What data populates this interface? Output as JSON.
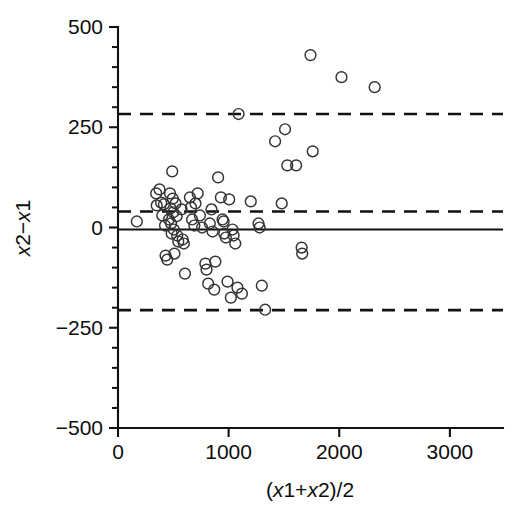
{
  "chart_data": {
    "type": "scatter",
    "title": "",
    "subtitle": "",
    "xlabel": "(x1+x2)/2",
    "ylabel": "x2-x1",
    "xlabel_parts": [
      "(",
      "x",
      "1+",
      "x",
      "2)/2"
    ],
    "ylabel_parts": [
      "x",
      "2−",
      "x",
      "1"
    ],
    "xlim": [
      0,
      3480
    ],
    "ylim": [
      -500,
      500
    ],
    "xticks": [
      0,
      1000,
      2000,
      3000
    ],
    "xtick_labels": [
      "0",
      "1000",
      "2000",
      "3000"
    ],
    "yticks": [
      -500,
      -250,
      0,
      250,
      500
    ],
    "ytick_labels": [
      "−500",
      "−250",
      "0",
      "250",
      "500"
    ],
    "y_minor_step": 50,
    "grid": false,
    "legend": null,
    "marker": {
      "shape": "open-circle",
      "radius": 5.4,
      "stroke": "#333333",
      "fill": "none"
    },
    "reference_lines": [
      {
        "name": "mean-difference",
        "value": -5,
        "style": "solid",
        "color": "#111111"
      },
      {
        "name": "upper-limit-of-agreement",
        "value": 283,
        "style": "dashed",
        "color": "#111111"
      },
      {
        "name": "mid-dashed-limit",
        "value": 40,
        "style": "dashed",
        "color": "#111111"
      },
      {
        "name": "lower-limit-of-agreement",
        "value": -206,
        "style": "dashed",
        "color": "#111111"
      }
    ],
    "series": [
      {
        "name": "difference-vs-mean",
        "points": [
          [
            170,
            15
          ],
          [
            345,
            85
          ],
          [
            350,
            55
          ],
          [
            375,
            95
          ],
          [
            390,
            62
          ],
          [
            400,
            30
          ],
          [
            415,
            58
          ],
          [
            425,
            5
          ],
          [
            430,
            -70
          ],
          [
            445,
            -80
          ],
          [
            460,
            20
          ],
          [
            470,
            85
          ],
          [
            475,
            48
          ],
          [
            480,
            10
          ],
          [
            485,
            -15
          ],
          [
            490,
            140
          ],
          [
            495,
            72
          ],
          [
            500,
            38
          ],
          [
            505,
            -5
          ],
          [
            510,
            -65
          ],
          [
            520,
            60
          ],
          [
            530,
            28
          ],
          [
            535,
            -20
          ],
          [
            545,
            -35
          ],
          [
            575,
            45
          ],
          [
            585,
            -30
          ],
          [
            595,
            -40
          ],
          [
            605,
            -115
          ],
          [
            650,
            75
          ],
          [
            660,
            50
          ],
          [
            670,
            20
          ],
          [
            690,
            5
          ],
          [
            700,
            60
          ],
          [
            720,
            85
          ],
          [
            740,
            30
          ],
          [
            760,
            0
          ],
          [
            790,
            -90
          ],
          [
            800,
            -105
          ],
          [
            815,
            -140
          ],
          [
            830,
            10
          ],
          [
            845,
            45
          ],
          [
            855,
            -10
          ],
          [
            870,
            -155
          ],
          [
            880,
            -85
          ],
          [
            905,
            125
          ],
          [
            930,
            75
          ],
          [
            945,
            20
          ],
          [
            955,
            15
          ],
          [
            960,
            -15
          ],
          [
            975,
            -25
          ],
          [
            990,
            -135
          ],
          [
            1005,
            70
          ],
          [
            1020,
            -175
          ],
          [
            1035,
            -5
          ],
          [
            1045,
            -20
          ],
          [
            1060,
            -40
          ],
          [
            1080,
            -150
          ],
          [
            1090,
            283
          ],
          [
            1120,
            -165
          ],
          [
            1200,
            65
          ],
          [
            1270,
            10
          ],
          [
            1280,
            0
          ],
          [
            1300,
            -145
          ],
          [
            1330,
            -205
          ],
          [
            1420,
            215
          ],
          [
            1480,
            60
          ],
          [
            1510,
            245
          ],
          [
            1530,
            155
          ],
          [
            1610,
            155
          ],
          [
            1660,
            -50
          ],
          [
            1665,
            -65
          ],
          [
            1740,
            430
          ],
          [
            1760,
            190
          ],
          [
            2020,
            375
          ],
          [
            2320,
            350
          ]
        ]
      }
    ]
  },
  "geometry": {
    "plot_left_px": 118,
    "plot_right_px": 503,
    "plot_top_px": 27,
    "plot_bottom_px": 428
  }
}
